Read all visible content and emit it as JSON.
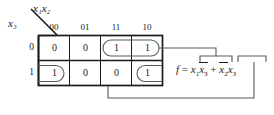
{
  "diagram": {
    "type": "karnaugh-map",
    "title": "",
    "axis": {
      "column_vars": "x1x2",
      "row_var": "x3",
      "column_vars_display": "x₁x₂",
      "row_var_display": "x₃"
    },
    "column_headers": [
      "00",
      "01",
      "11",
      "10"
    ],
    "row_headers": [
      "0",
      "1"
    ],
    "cells": [
      [
        "0",
        "0",
        "1",
        "1"
      ],
      [
        "1",
        "0",
        "0",
        "1"
      ]
    ],
    "groups": [
      {
        "name": "group-top-x1-x3bar",
        "term": "x1 x3'",
        "cells": [
          [
            0,
            2
          ],
          [
            0,
            3
          ]
        ],
        "wrap": false
      },
      {
        "name": "group-bottom-x2bar-x3",
        "term": "x2' x3",
        "cells": [
          [
            1,
            0
          ],
          [
            1,
            3
          ]
        ],
        "wrap": true
      }
    ],
    "equation": {
      "lhs": "f",
      "equals": "=",
      "term1": {
        "v1": "x",
        "s1": "1",
        "v2": "x",
        "s2": "3",
        "v2_bar": true,
        "v1_bar": false
      },
      "plus": "+",
      "term2": {
        "v1": "x",
        "s1": "2",
        "v2": "x",
        "s2": "3",
        "v1_bar": true,
        "v2_bar": false
      },
      "plain": "f = x1x3 + x2x3"
    },
    "colors": {
      "ink": "#1a1a1a",
      "grid": "#1a1a1a",
      "loop": "#4a4a4a",
      "connector": "#4a4a4a",
      "background": "#ffffff"
    }
  }
}
